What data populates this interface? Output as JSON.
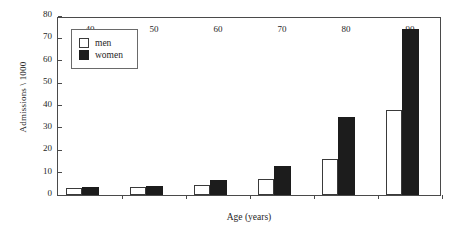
{
  "chart_data": {
    "type": "bar",
    "title": "",
    "xlabel": "Age (years)",
    "ylabel": "Admissions \\ 1000",
    "categories": [
      "40",
      "50",
      "60",
      "70",
      "80",
      "90"
    ],
    "series": [
      {
        "name": "men",
        "color": "#ffffff",
        "values": [
          3,
          3.5,
          4.5,
          7,
          16,
          38
        ]
      },
      {
        "name": "women",
        "color": "#1c1c1c",
        "values": [
          3.5,
          4,
          6.5,
          13,
          35,
          74
        ]
      }
    ],
    "ylim": [
      0,
      80
    ],
    "yticks": [
      0,
      10,
      20,
      30,
      40,
      50,
      60,
      70,
      80
    ],
    "ytick_labels": [
      "0",
      "10",
      "20",
      "30",
      "40",
      "50",
      "60",
      "70",
      "80"
    ],
    "grid": false,
    "legend_position": "top-left",
    "frame": true
  },
  "legend": {
    "items": [
      {
        "label": "men",
        "swatch": "open-square-icon"
      },
      {
        "label": "women",
        "swatch": "filled-square-icon"
      }
    ]
  }
}
